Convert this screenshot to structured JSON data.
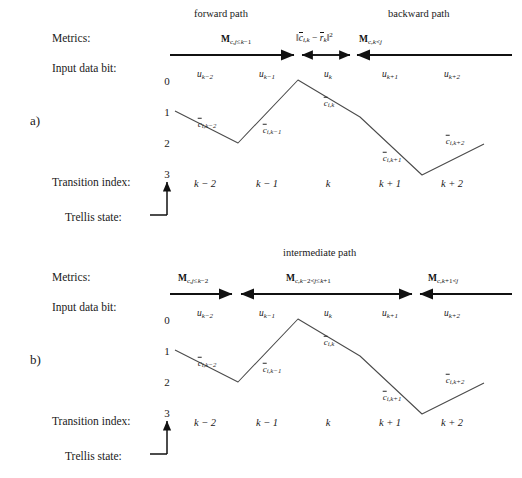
{
  "figure": {
    "type": "trellis-diagram",
    "panels": [
      {
        "id": "a",
        "letter": "a)",
        "path_titles": [
          {
            "text": "forward path",
            "x": 232,
            "y": 14
          },
          {
            "text": "backward path",
            "x": 430,
            "y": 14
          }
        ],
        "row_labels": {
          "metrics": "Metrics:",
          "input_data_bit": "Input data bit:",
          "transition_index": "Transition index:",
          "trellis_state": "Trellis state:"
        },
        "metrics": [
          {
            "id": "forward",
            "base": "M",
            "sub": "c,j≤k−1",
            "direction": "right",
            "x1": 170,
            "x2": 296,
            "label_x": 255,
            "label_y": 37
          },
          {
            "id": "branch",
            "base": "norm",
            "text": "‖c̄ᵢ,ₖ − r̄ₖ‖²",
            "direction": "both",
            "x1": 300,
            "x2": 352,
            "label_x": 326,
            "label_y": 35
          },
          {
            "id": "backward",
            "base": "M",
            "sub": "c,k<j",
            "direction": "left",
            "x1": 357,
            "x2": 510,
            "label_x": 394,
            "label_y": 37
          }
        ],
        "input_bits": [
          {
            "label": "u",
            "sub": "k−2",
            "x": 205
          },
          {
            "label": "u",
            "sub": "k−1",
            "x": 267
          },
          {
            "label": "u",
            "sub": "k",
            "x": 328
          },
          {
            "label": "u",
            "sub": "k+1",
            "x": 390
          },
          {
            "label": "u",
            "sub": "k+2",
            "x": 452
          }
        ],
        "states": [
          "0",
          "1",
          "2",
          "3"
        ],
        "transition_indices": [
          {
            "label": "k − 2",
            "x": 205
          },
          {
            "label": "k − 1",
            "x": 267
          },
          {
            "label": "k",
            "x": 328
          },
          {
            "label": "k + 1",
            "x": 390
          },
          {
            "label": "k + 2",
            "x": 452
          }
        ],
        "path_points": [
          {
            "x": 175,
            "y": 111
          },
          {
            "x": 238,
            "y": 143
          },
          {
            "x": 298,
            "y": 80
          },
          {
            "x": 360,
            "y": 117
          },
          {
            "x": 422,
            "y": 175
          },
          {
            "x": 484,
            "y": 144
          }
        ],
        "codeword_labels": [
          {
            "label": "c̄",
            "sub": "i,k−2",
            "x": 207,
            "y": 124
          },
          {
            "label": "c̄",
            "sub": "i,k−1",
            "x": 272,
            "y": 130
          },
          {
            "label": "c̄",
            "sub": "i,k",
            "x": 329,
            "y": 103
          },
          {
            "label": "c̄",
            "sub": "i,k+1",
            "x": 392,
            "y": 158
          },
          {
            "label": "c̄",
            "sub": "i,k+2",
            "x": 455,
            "y": 141
          }
        ]
      },
      {
        "id": "b",
        "letter": "b)",
        "path_titles": [
          {
            "text": "intermediate path",
            "x": 328,
            "y": 14
          }
        ],
        "row_labels": {
          "metrics": "Metrics:",
          "input_data_bit": "Input data bit:",
          "transition_index": "Transition index:",
          "trellis_state": "Trellis state:"
        },
        "metrics": [
          {
            "id": "left",
            "base": "M",
            "sub": "c,j≤k−2",
            "direction": "right",
            "x1": 170,
            "x2": 234,
            "label_x": 178,
            "label_y": 37
          },
          {
            "id": "middle",
            "base": "M",
            "sub": "c,k−2<j≤k+1",
            "direction": "both",
            "x1": 240,
            "x2": 414,
            "label_x": 288,
            "label_y": 37
          },
          {
            "id": "right",
            "base": "M",
            "sub": "c,k+1<j",
            "direction": "left",
            "x1": 420,
            "x2": 510,
            "label_x": 428,
            "label_y": 37
          }
        ],
        "input_bits": [
          {
            "label": "u",
            "sub": "k−2",
            "x": 205
          },
          {
            "label": "u",
            "sub": "k−1",
            "x": 267
          },
          {
            "label": "u",
            "sub": "k",
            "x": 328
          },
          {
            "label": "u",
            "sub": "k+1",
            "x": 390
          },
          {
            "label": "u",
            "sub": "k+2",
            "x": 452
          }
        ],
        "states": [
          "0",
          "1",
          "2",
          "3"
        ],
        "transition_indices": [
          {
            "label": "k − 2",
            "x": 205
          },
          {
            "label": "k − 1",
            "x": 267
          },
          {
            "label": "k",
            "x": 328
          },
          {
            "label": "k + 1",
            "x": 390
          },
          {
            "label": "k + 2",
            "x": 452
          }
        ],
        "path_points": [
          {
            "x": 175,
            "y": 111
          },
          {
            "x": 238,
            "y": 143
          },
          {
            "x": 298,
            "y": 80
          },
          {
            "x": 360,
            "y": 117
          },
          {
            "x": 422,
            "y": 175
          },
          {
            "x": 484,
            "y": 144
          }
        ],
        "codeword_labels": [
          {
            "label": "c̄",
            "sub": "i,k−2",
            "x": 207,
            "y": 124
          },
          {
            "label": "c̄",
            "sub": "i,k−1",
            "x": 272,
            "y": 130
          },
          {
            "label": "c̄",
            "sub": "i,k",
            "x": 329,
            "y": 103
          },
          {
            "label": "c̄",
            "sub": "i,k+1",
            "x": 392,
            "y": 158
          },
          {
            "label": "c̄",
            "sub": "i,k+2",
            "x": 455,
            "y": 141
          }
        ]
      }
    ],
    "colors": {
      "ink": "#1a1a1a",
      "line": "#3a3a3a",
      "arrow": "#111111",
      "background": "#ffffff"
    }
  }
}
